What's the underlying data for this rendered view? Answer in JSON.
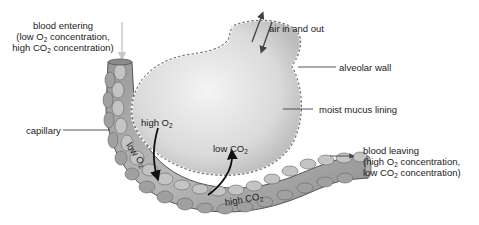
{
  "labels": {
    "blood_entering": {
      "line1": "blood entering",
      "line2_pre": "(low O",
      "line2_sub": "2",
      "line2_post": " concentration,",
      "line3_pre": "high CO",
      "line3_sub": "2",
      "line3_post": " concentration)"
    },
    "air": "air in and out",
    "alveolar_wall": "alveolar wall",
    "moist_mucus": "moist mucus lining",
    "capillary": "capillary",
    "high_o2": {
      "pre": "high O",
      "sub": "2"
    },
    "low_o2": {
      "pre": "low O",
      "sub": "2"
    },
    "low_co2": {
      "pre": "low CO",
      "sub": "2"
    },
    "high_co2": {
      "pre": "high CO",
      "sub": "2"
    },
    "blood_leaving": {
      "line1": "blood leaving",
      "line2_pre": "(high O",
      "line2_sub": "2",
      "line2_post": " concentration,",
      "line3_pre": "low CO",
      "line3_sub": "2",
      "line3_post": " concentration)"
    }
  },
  "colors": {
    "alveolus_fill": "#dcdcdc",
    "capillary_fill": "#a9a9a9",
    "cell_fill": "#bdbdbd",
    "outline": "#555555",
    "arrow": "#111111",
    "leader_line": "#444444",
    "entering_arrow": "#c8c8c8"
  }
}
